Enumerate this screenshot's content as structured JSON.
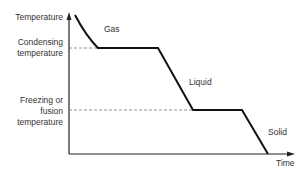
{
  "diagram": {
    "y_axis_label": "Temperature",
    "x_axis_label": "Time",
    "levels": {
      "condensing": [
        "Condensing",
        "temperature"
      ],
      "freezing": [
        "Freezing or",
        "fusion",
        "temperature"
      ]
    },
    "phases": {
      "gas": "Gas",
      "liquid": "Liquid",
      "solid": "Solid"
    },
    "colors": {
      "curve": "#111111",
      "axis": "#222222",
      "dashed": "#777777",
      "text": "#333333"
    }
  }
}
